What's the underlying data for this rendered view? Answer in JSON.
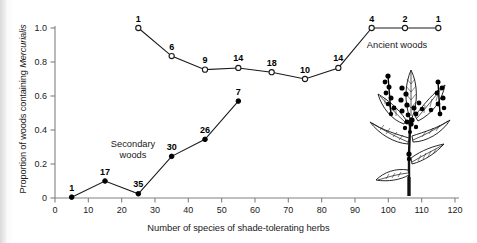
{
  "figure": {
    "background_color": "#ffffff",
    "ink_color": "#1a1a1a",
    "axis_color": "#808080"
  },
  "axes": {
    "y_title_prefix": "Proportion of woods containing ",
    "y_title_italic": "Mercurialis",
    "x_title": "Number of species of shade-tolerating herbs",
    "y_ticks": [
      "0.2",
      "0.4",
      "0.6",
      "0.8",
      "1.0"
    ],
    "x_ticks": [
      "0",
      "10",
      "20",
      "30",
      "40",
      "50",
      "60",
      "70",
      "80",
      "90",
      "100",
      "110",
      "120"
    ]
  },
  "series_labels": {
    "ancient": "Ancient woods",
    "secondary_line1": "Secondary",
    "secondary_line2": "woods"
  },
  "illustration": {
    "name": "mercurialis-perennis-plant-drawing",
    "caption": ""
  },
  "chart_data": {
    "type": "line",
    "title": "",
    "subtitle": "",
    "xlabel": "Number of species of shade-tolerating herbs",
    "ylabel": "Proportion of woods containing Mercurialis",
    "xlim": [
      0,
      120
    ],
    "ylim": [
      0,
      1.05
    ],
    "xticks": [
      0,
      10,
      20,
      30,
      40,
      50,
      60,
      70,
      80,
      90,
      100,
      110,
      120
    ],
    "yticks": [
      0.2,
      0.4,
      0.6,
      0.8,
      1.0
    ],
    "grid": false,
    "legend_position": "inline-annotation",
    "series": [
      {
        "name": "Ancient woods",
        "marker": "open-circle",
        "x": [
          25,
          35,
          45,
          55,
          65,
          75,
          85,
          95,
          105,
          115
        ],
        "y": [
          1.0,
          0.835,
          0.755,
          0.765,
          0.74,
          0.7,
          0.765,
          1.0,
          1.0,
          1.0
        ],
        "point_labels": [
          "1",
          "6",
          "9",
          "14",
          "18",
          "10",
          "14",
          "4",
          "2",
          "1"
        ]
      },
      {
        "name": "Secondary woods",
        "marker": "filled-circle",
        "x": [
          5,
          15,
          25,
          35,
          45,
          55
        ],
        "y": [
          0.005,
          0.1,
          0.025,
          0.245,
          0.345,
          0.57
        ],
        "point_labels": [
          "1",
          "17",
          "35",
          "30",
          "26",
          "7"
        ]
      }
    ],
    "annotations": [
      {
        "text": "Ancient woods",
        "x": 100,
        "y": 0.9
      },
      {
        "text": "Secondary woods",
        "x": 32,
        "y": 0.3
      }
    ]
  }
}
